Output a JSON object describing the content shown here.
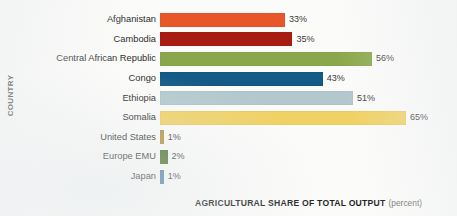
{
  "chart_data": {
    "type": "bar",
    "orientation": "horizontal",
    "title": "",
    "xlabel": "AGRICULTURAL SHARE OF TOTAL OUTPUT",
    "xlabel_unit": "(percent)",
    "ylabel": "COUNTRY",
    "grid": false,
    "legend": false,
    "xlim": [
      0,
      65
    ],
    "value_suffix": "%",
    "categories": [
      "Afghanistan",
      "Cambodia",
      "Central African Republic",
      "Congo",
      "Ethiopia",
      "Somalia",
      "United States",
      "Europe EMU",
      "Japan"
    ],
    "values": [
      33,
      35,
      56,
      43,
      51,
      65,
      1,
      2,
      1
    ],
    "value_labels": [
      "33%",
      "35%",
      "56%",
      "43%",
      "51%",
      "65%",
      "1%",
      "2%",
      "1%"
    ],
    "bar_colors": [
      "#e8572a",
      "#a81d12",
      "#8aa84b",
      "#135a86",
      "#b3c8ce",
      "#f0d165",
      "#b5903c",
      "#4b7029",
      "#4d81ab"
    ],
    "bars": [
      {
        "category": "Afghanistan",
        "value": 33,
        "label": "33%",
        "color": "#e8572a"
      },
      {
        "category": "Cambodia",
        "value": 35,
        "label": "35%",
        "color": "#a81d12"
      },
      {
        "category": "Central African Republic",
        "value": 56,
        "label": "56%",
        "color": "#8aa84b"
      },
      {
        "category": "Congo",
        "value": 43,
        "label": "43%",
        "color": "#135a86"
      },
      {
        "category": "Ethiopia",
        "value": 51,
        "label": "51%",
        "color": "#b3c8ce"
      },
      {
        "category": "Somalia",
        "value": 65,
        "label": "65%",
        "color": "#f0d165"
      },
      {
        "category": "United States",
        "value": 1,
        "label": "1%",
        "color": "#b5903c"
      },
      {
        "category": "Europe EMU",
        "value": 2,
        "label": "2%",
        "color": "#4b7029"
      },
      {
        "category": "Japan",
        "value": 1,
        "label": "1%",
        "color": "#4d81ab"
      }
    ]
  },
  "colors": {
    "background": "#fbfbf9",
    "label_text": "#2b2b2b",
    "value_text": "#3a3a3a",
    "axis_title": "#1f1f1f",
    "axis_unit": "#737373"
  }
}
